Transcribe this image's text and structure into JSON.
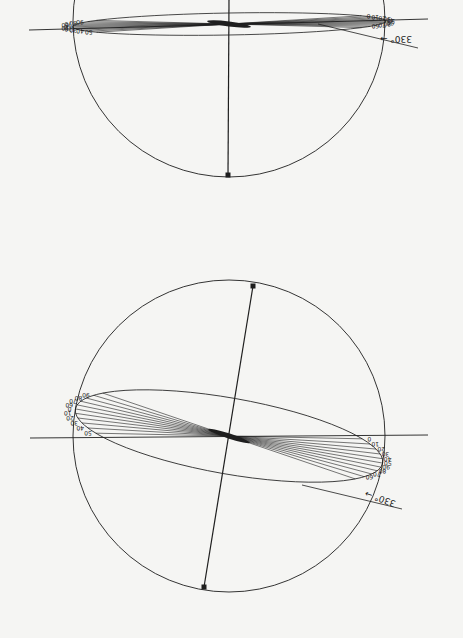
{
  "diagram": {
    "orientation": "rotated 180 degrees",
    "line_color": "#1e1e1e",
    "background": "#f5f5f3",
    "figures": [
      {
        "id": "top",
        "circle": {
          "cx": 229,
          "cy": 21,
          "r": 156
        },
        "axis_line": {
          "x1": 229,
          "y1": 0,
          "x2": 228,
          "y2": 175
        },
        "horizontal_line": {
          "x1": 29,
          "y1": 30,
          "x2": 428,
          "y2": 19
        },
        "ellipse": {
          "cx": 229,
          "cy": 24,
          "rx": 157,
          "ry": 11,
          "rot": -1
        },
        "angle_label": "330°",
        "tick_labels_left_upper": [
          "50",
          "40",
          "30",
          "20",
          "10",
          "0"
        ],
        "tick_labels_left_lower": [
          "60",
          "70",
          "80",
          "90"
        ],
        "tick_labels_right_upper": [
          "90",
          "80",
          "70",
          "60"
        ],
        "tick_labels_right_lower": [
          "0",
          "10",
          "20",
          "30",
          "40",
          "50"
        ]
      },
      {
        "id": "bottom",
        "circle": {
          "cx": 229,
          "cy": 436,
          "r": 156
        },
        "axis_line": {
          "x1": 253,
          "y1": 286,
          "x2": 204,
          "y2": 587
        },
        "horizontal_line": {
          "x1": 30,
          "y1": 438,
          "x2": 428,
          "y2": 435
        },
        "ellipse": {
          "cx": 229,
          "cy": 436,
          "rx": 156,
          "ry": 38,
          "rot": 10
        },
        "angle_label": "330°",
        "tick_labels_left_upper": [
          "50",
          "40",
          "30",
          "20",
          "10",
          "0"
        ],
        "tick_labels_left_lower": [
          "60",
          "70",
          "80",
          "90"
        ],
        "tick_labels_right_upper": [
          "90",
          "80",
          "70",
          "60"
        ],
        "tick_labels_right_lower": [
          "0",
          "10",
          "20",
          "30",
          "40",
          "50"
        ]
      }
    ]
  }
}
